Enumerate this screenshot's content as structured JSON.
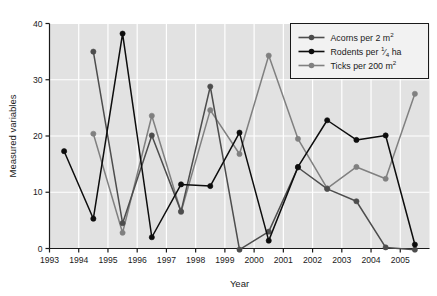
{
  "chart_data": {
    "type": "line",
    "title": "",
    "xlabel": "Year",
    "ylabel": "Measured variables",
    "xlim": [
      1993,
      2006
    ],
    "ylim": [
      0,
      40
    ],
    "yticks": [
      0,
      10,
      20,
      30,
      40
    ],
    "xticks": [
      1993,
      1994,
      1995,
      1996,
      1997,
      1998,
      1999,
      2000,
      2001,
      2002,
      2003,
      2004,
      2005
    ],
    "xtick_labels": [
      "1993",
      "1994",
      "1995",
      "1996",
      "1997",
      "1998",
      "1999",
      "2000",
      "2001",
      "2002",
      "2003",
      "2004",
      "2005"
    ],
    "ytick_labels": [
      "0",
      "10",
      "20",
      "30",
      "40"
    ],
    "grid": true,
    "grid_color": "#ffffff",
    "plot_background": "#e2e2e2",
    "legend_position": "top-right",
    "x": [
      1993.5,
      1994.5,
      1995.5,
      1996.5,
      1997.5,
      1998.5,
      1999.5,
      2000.5,
      2001.5,
      2002.5,
      2003.5,
      2004.5,
      2005.5
    ],
    "series": [
      {
        "name": "Acorns per 2 m2",
        "label_text": "Acorns per 2 m",
        "label_sup": "2",
        "color": "#4d4d4d",
        "marker": "circle",
        "values": [
          null,
          35.0,
          4.5,
          20.1,
          6.6,
          28.8,
          -0.2,
          3.0,
          14.4,
          10.6,
          8.4,
          0.2,
          -0.2
        ]
      },
      {
        "name": "Rodents per 1/4 ha",
        "label_text": "Rodents per",
        "label_frac_num": "1",
        "label_frac_den": "4",
        "label_tail": "ha",
        "color": "#0d0d0d",
        "marker": "circle",
        "values": [
          17.3,
          5.3,
          38.2,
          2.0,
          11.4,
          11.1,
          20.6,
          1.4,
          14.5,
          22.8,
          19.3,
          20.1,
          0.7
        ]
      },
      {
        "name": "Ticks per 200 m2",
        "label_text": "Ticks per 200 m",
        "label_sup": "2",
        "color": "#808080",
        "marker": "circle",
        "values": [
          null,
          20.4,
          2.8,
          23.6,
          6.5,
          24.6,
          16.8,
          34.3,
          19.5,
          10.7,
          14.5,
          12.4,
          27.5
        ]
      }
    ]
  },
  "legend": {
    "items": [
      {
        "key": "acorns",
        "text": "Acorns per 2 m",
        "sup": "2"
      },
      {
        "key": "rodents",
        "text": "Rodents per",
        "frac_num": "1",
        "frac_den": "4",
        "tail": "ha"
      },
      {
        "key": "ticks",
        "text": "Ticks per 200 m",
        "sup": "2"
      }
    ]
  }
}
